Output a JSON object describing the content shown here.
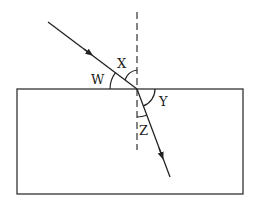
{
  "diagram": {
    "type": "refraction",
    "labels": {
      "W": "W",
      "X": "X",
      "Y": "Y",
      "Z": "Z"
    },
    "colors": {
      "stroke": "#222222",
      "background": "#ffffff"
    }
  }
}
